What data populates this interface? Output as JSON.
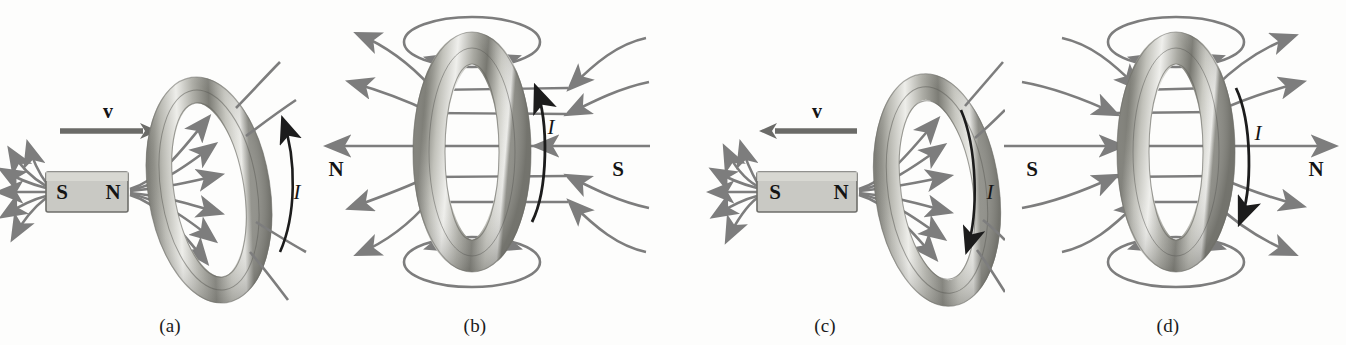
{
  "figure": {
    "background_color": "#fdfdfc",
    "field_line_color": "#7d7d7d",
    "current_arrow_color": "#1c1c1c",
    "magnet_fill_color": "#c9c9c4",
    "magnet_stroke_color": "#6e6e6a",
    "ring_light_color": "#efefec",
    "ring_mid_color": "#b4b4ae",
    "ring_dark_color": "#6f6f6a",
    "label_color": "#141414"
  },
  "panels": [
    {
      "id": "a",
      "caption": "(a)",
      "view": "perspective",
      "velocity": {
        "label": "v",
        "direction": "right",
        "shown": true
      },
      "magnet": {
        "shown": true,
        "left_pole": "S",
        "right_pole": "N"
      },
      "current": {
        "label": "I",
        "direction": "up",
        "arrow_head": "top"
      },
      "poles_left_right": null,
      "field_lines_direction": "out-of-N-into-ring"
    },
    {
      "id": "b",
      "caption": "(b)",
      "view": "front",
      "velocity": {
        "shown": false,
        "label": null,
        "direction": null
      },
      "magnet": {
        "shown": false,
        "left_pole": null,
        "right_pole": null
      },
      "current": {
        "label": "I",
        "direction": "up",
        "arrow_head": "top"
      },
      "poles_left_right": {
        "left": "N",
        "right": "S"
      },
      "field_lines_direction": "right-to-left"
    },
    {
      "id": "c",
      "caption": "(c)",
      "view": "perspective",
      "velocity": {
        "label": "v",
        "direction": "left",
        "shown": true
      },
      "magnet": {
        "shown": true,
        "left_pole": "S",
        "right_pole": "N"
      },
      "current": {
        "label": "I",
        "direction": "down",
        "arrow_head": "bottom"
      },
      "poles_left_right": null,
      "field_lines_direction": "out-of-N-into-ring"
    },
    {
      "id": "d",
      "caption": "(d)",
      "view": "front",
      "velocity": {
        "shown": false,
        "label": null,
        "direction": null
      },
      "magnet": {
        "shown": false,
        "left_pole": null,
        "right_pole": null
      },
      "current": {
        "label": "I",
        "direction": "down",
        "arrow_head": "bottom"
      },
      "poles_left_right": {
        "left": "S",
        "right": "N"
      },
      "field_lines_direction": "left-to-right"
    }
  ]
}
